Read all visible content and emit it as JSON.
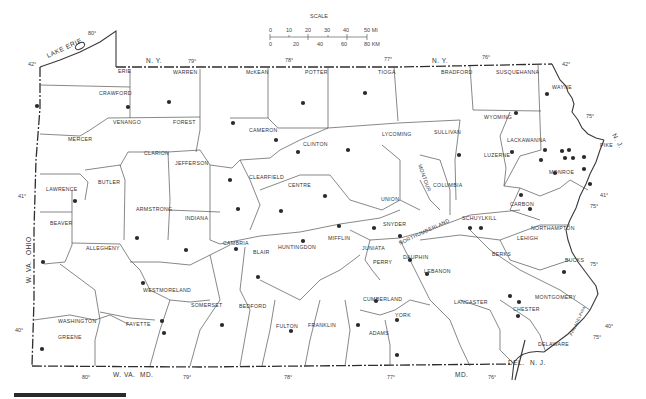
{
  "map": {
    "region": "Pennsylvania",
    "scale": {
      "title": "SCALE",
      "mi_ticks": [
        "0",
        "10",
        "20",
        "30",
        "40",
        "50 MI"
      ],
      "km_ticks": [
        "0",
        "20",
        "40",
        "60",
        "80 KM"
      ]
    },
    "neighbors": {
      "ny_top_left": "N. Y.",
      "ny_top_right": "N. Y.",
      "nj_right": "N. J.",
      "nj_bottom": "N. J.",
      "del": "DEL.",
      "md_left": "MD.",
      "md_right": "MD.",
      "wva_bottom": "W. VA.",
      "wva_side": "W. VA.",
      "ohio": "OHIO",
      "lake": "LAKE ERIE"
    },
    "graticule": {
      "lon_top": [
        "80°",
        "79°",
        "78°",
        "77°",
        "76°"
      ],
      "lon_bottom": [
        "80°",
        "79°",
        "78°",
        "77°",
        "76°"
      ],
      "lat_left": [
        "42°",
        "41°",
        "40°"
      ],
      "lat_right": [
        "42°",
        "41°",
        "40°"
      ],
      "lon_right": [
        "75°",
        "75°",
        "75°",
        "75°"
      ]
    },
    "counties": {
      "erie": "ERIE",
      "crawford": "CRAWFORD",
      "warren": "WARREN",
      "mckean": "McKEAN",
      "potter": "POTTER",
      "tioga": "TIOGA",
      "bradford": "BRADFORD",
      "susquehanna": "SUSQUEHANNA",
      "wayne": "WAYNE",
      "mercer": "MERCER",
      "venango": "VENANGO",
      "forest": "FOREST",
      "cameron": "CAMERON",
      "clinton": "CLINTON",
      "lycoming": "LYCOMING",
      "sullivan": "SULLIVAN",
      "wyoming": "WYOMING",
      "lackawanna": "LACKAWANNA",
      "pike": "PIKE",
      "luzerne": "LUZERNE",
      "monroe": "MONROE",
      "clarion": "CLARION",
      "jefferson": "JEFFERSON",
      "elk": "",
      "clearfield": "CLEARFIELD",
      "centre": "CENTRE",
      "union": "UNION",
      "montour": "MONTOUR",
      "columbia": "COLUMBIA",
      "carbon": "CARBON",
      "lawrence": "LAWRENCE",
      "butler": "BUTLER",
      "armstrong": "ARMSTRONG",
      "indiana": "INDIANA",
      "snyder": "SNYDER",
      "schuylkill": "SCHUYLKILL",
      "northampton": "NORTHAMPTON",
      "lehigh": "LEHIGH",
      "beaver": "BEAVER",
      "allegheny": "ALLEGHENY",
      "cambria": "CAMBRIA",
      "blair": "BLAIR",
      "huntingdon": "HUNTINGDON",
      "mifflin": "MIFFLIN",
      "juniata": "JUNIATA",
      "northumberland": "NORTHUMBERLAND",
      "dauphin": "DAUPHIN",
      "perry": "PERRY",
      "lebanon": "LEBANON",
      "berks": "BERKS",
      "bucks": "BUCKS",
      "westmoreland": "WESTMORELAND",
      "washington": "WASHINGTON",
      "fayette": "FAYETTE",
      "somerset": "SOMERSET",
      "bedford": "BEDFORD",
      "fulton": "FULTON",
      "franklin": "FRANKLIN",
      "cumberland": "CUMBERLAND",
      "adams": "ADAMS",
      "york": "YORK",
      "lancaster": "LANCASTER",
      "chester": "CHESTER",
      "montgomery": "MONTGOMERY",
      "delaware": "DELAWARE",
      "greene": "GREENE",
      "philadelphia": "PHILADELPHIA"
    },
    "dot_color": "#2a2a2a",
    "dots": [
      [
        37,
        106
      ],
      [
        169,
        102
      ],
      [
        233,
        123
      ],
      [
        303,
        103
      ],
      [
        365,
        93
      ],
      [
        128,
        107
      ],
      [
        516,
        113
      ],
      [
        547,
        94
      ],
      [
        276,
        140
      ],
      [
        298,
        152
      ],
      [
        348,
        150
      ],
      [
        230,
        180
      ],
      [
        238,
        209
      ],
      [
        281,
        211
      ],
      [
        325,
        196
      ],
      [
        339,
        226
      ],
      [
        374,
        228
      ],
      [
        303,
        241
      ],
      [
        400,
        236
      ],
      [
        410,
        260
      ],
      [
        376,
        301
      ],
      [
        427,
        274
      ],
      [
        459,
        155
      ],
      [
        512,
        152
      ],
      [
        541,
        160
      ],
      [
        545,
        150
      ],
      [
        562,
        151
      ],
      [
        569,
        150
      ],
      [
        565,
        158
      ],
      [
        573,
        158
      ],
      [
        584,
        157
      ],
      [
        584,
        169
      ],
      [
        555,
        173
      ],
      [
        590,
        184
      ],
      [
        521,
        195
      ],
      [
        530,
        209
      ],
      [
        470,
        228
      ],
      [
        481,
        228
      ],
      [
        75,
        201
      ],
      [
        137,
        238
      ],
      [
        186,
        250
      ],
      [
        143,
        283
      ],
      [
        236,
        249
      ],
      [
        258,
        277
      ],
      [
        43,
        262
      ],
      [
        162,
        321
      ],
      [
        164,
        333
      ],
      [
        42,
        349
      ],
      [
        222,
        325
      ],
      [
        291,
        331
      ],
      [
        358,
        325
      ],
      [
        397,
        320
      ],
      [
        397,
        355
      ],
      [
        510,
        296
      ],
      [
        519,
        302
      ],
      [
        518,
        316
      ],
      [
        564,
        272
      ]
    ],
    "bottom_bar": true
  }
}
